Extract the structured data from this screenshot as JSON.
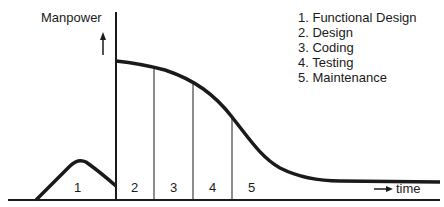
{
  "diagram": {
    "y_axis_label": "Manpower",
    "x_axis_label": "time",
    "legend": [
      "1. Functional Design",
      "2. Design",
      "3. Coding",
      "4. Testing",
      "5. Maintenance"
    ],
    "phase_labels": [
      "1",
      "2",
      "3",
      "4",
      "5"
    ],
    "colors": {
      "line": "#1a1a1a",
      "background": "#ffffff"
    }
  }
}
